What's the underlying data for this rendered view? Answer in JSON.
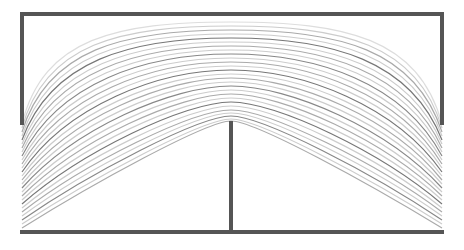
{
  "diagram": {
    "type": "streamline-flow",
    "width": 464,
    "height": 250,
    "background": "#ffffff",
    "wall_color": "#555555",
    "wall_width": 4,
    "walls": {
      "top": {
        "x1": 22,
        "y1": 14,
        "x2": 442,
        "y2": 14
      },
      "left": {
        "x1": 22,
        "y1": 14,
        "x2": 22,
        "y2": 123
      },
      "right": {
        "x1": 442,
        "y1": 14,
        "x2": 442,
        "y2": 123
      },
      "bottom": {
        "x1": 22,
        "y1": 232,
        "x2": 442,
        "y2": 232
      },
      "center_plate": {
        "x1": 231,
        "y1": 123,
        "x2": 231,
        "y2": 232
      }
    },
    "inlet": {
      "x": 22,
      "y_top": 123,
      "y_bottom": 232
    },
    "outlet": {
      "x": 442,
      "y_top": 123,
      "y_bottom": 232
    },
    "center_x": 231,
    "streamlines": [
      {
        "y_edge": 124,
        "y_center": 22,
        "color": "#dddddd"
      },
      {
        "y_edge": 128,
        "y_center": 26,
        "color": "#cccccc"
      },
      {
        "y_edge": 132,
        "y_center": 30,
        "color": "#aaaaaa"
      },
      {
        "y_edge": 136,
        "y_center": 34,
        "color": "#cccccc"
      },
      {
        "y_edge": 140,
        "y_center": 38,
        "color": "#777777"
      },
      {
        "y_edge": 144,
        "y_center": 42,
        "color": "#cccccc"
      },
      {
        "y_edge": 148,
        "y_center": 46,
        "color": "#aaaaaa"
      },
      {
        "y_edge": 152,
        "y_center": 50,
        "color": "#cccccc"
      },
      {
        "y_edge": 156,
        "y_center": 54,
        "color": "#888888"
      },
      {
        "y_edge": 160,
        "y_center": 58,
        "color": "#cccccc"
      },
      {
        "y_edge": 164,
        "y_center": 62,
        "color": "#aaaaaa"
      },
      {
        "y_edge": 168,
        "y_center": 66,
        "color": "#cccccc"
      },
      {
        "y_edge": 172,
        "y_center": 70,
        "color": "#777777"
      },
      {
        "y_edge": 176,
        "y_center": 74,
        "color": "#cccccc"
      },
      {
        "y_edge": 180,
        "y_center": 78,
        "color": "#aaaaaa"
      },
      {
        "y_edge": 184,
        "y_center": 82,
        "color": "#cccccc"
      },
      {
        "y_edge": 188,
        "y_center": 86,
        "color": "#888888"
      },
      {
        "y_edge": 192,
        "y_center": 90,
        "color": "#cccccc"
      },
      {
        "y_edge": 196,
        "y_center": 94,
        "color": "#aaaaaa"
      },
      {
        "y_edge": 200,
        "y_center": 98,
        "color": "#cccccc"
      },
      {
        "y_edge": 204,
        "y_center": 102,
        "color": "#777777"
      },
      {
        "y_edge": 208,
        "y_center": 106,
        "color": "#cccccc"
      },
      {
        "y_edge": 212,
        "y_center": 110,
        "color": "#aaaaaa"
      },
      {
        "y_edge": 216,
        "y_center": 113,
        "color": "#cccccc"
      },
      {
        "y_edge": 220,
        "y_center": 116,
        "color": "#888888"
      },
      {
        "y_edge": 224,
        "y_center": 119,
        "color": "#cccccc"
      },
      {
        "y_edge": 228,
        "y_center": 121,
        "color": "#aaaaaa"
      }
    ]
  }
}
